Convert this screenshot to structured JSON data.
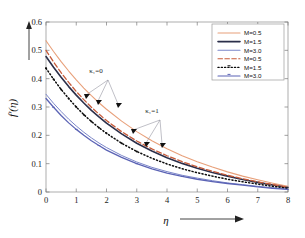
{
  "chart_data": {
    "type": "line",
    "title": "",
    "subtitle": "",
    "xlabel": "η",
    "ylabel": "f'(η)",
    "xlim": [
      0,
      8
    ],
    "ylim": [
      0,
      0.6
    ],
    "xticks": [
      "0",
      "1",
      "2",
      "3",
      "4",
      "5",
      "6",
      "7",
      "8"
    ],
    "yticks": [
      "0",
      "0.1",
      "0.2",
      "0.3",
      "0.4",
      "0.5",
      "0.6"
    ],
    "xtick_values": [
      0,
      1,
      2,
      3,
      4,
      5,
      6,
      7,
      8
    ],
    "ytick_values": [
      0,
      0.1,
      0.2,
      0.3,
      0.4,
      0.5,
      0.6
    ],
    "grid": false,
    "legend_position": "top-right",
    "x": [
      0,
      0.25,
      0.5,
      0.75,
      1.0,
      1.25,
      1.5,
      1.75,
      2.0,
      2.5,
      3.0,
      3.5,
      4.0,
      4.5,
      5.0,
      5.5,
      6.0,
      6.5,
      7.0,
      7.5,
      8.0
    ],
    "series": [
      {
        "name": "M=0.5",
        "group": "κ₁=0",
        "style": "solid",
        "color": "#e8a07a",
        "marker": "none",
        "width": 1.1,
        "values": [
          0.534,
          0.496,
          0.46,
          0.427,
          0.396,
          0.367,
          0.34,
          0.315,
          0.292,
          0.25,
          0.213,
          0.181,
          0.153,
          0.128,
          0.107,
          0.088,
          0.071,
          0.056,
          0.043,
          0.031,
          0.02
        ]
      },
      {
        "name": "M=1.5",
        "group": "κ₁=0",
        "style": "solid",
        "color": "#2b2f4a",
        "marker": "none",
        "width": 1.6,
        "values": [
          0.478,
          0.44,
          0.405,
          0.372,
          0.342,
          0.314,
          0.288,
          0.265,
          0.243,
          0.205,
          0.172,
          0.145,
          0.121,
          0.101,
          0.084,
          0.069,
          0.056,
          0.044,
          0.034,
          0.025,
          0.016
        ]
      },
      {
        "name": "M=3.0",
        "group": "κ₁=0",
        "style": "solid",
        "color": "#7b86c9",
        "marker": "none",
        "width": 1.0,
        "values": [
          0.345,
          0.313,
          0.284,
          0.257,
          0.233,
          0.211,
          0.191,
          0.173,
          0.157,
          0.129,
          0.106,
          0.087,
          0.072,
          0.059,
          0.049,
          0.04,
          0.032,
          0.026,
          0.02,
          0.015,
          0.01
        ]
      },
      {
        "name": "M=0.5",
        "group": "κ₁=1",
        "style": "dashed",
        "color": "#c75b3a",
        "marker": "none",
        "width": 1.3,
        "values": [
          0.5,
          0.459,
          0.421,
          0.387,
          0.355,
          0.326,
          0.299,
          0.275,
          0.252,
          0.213,
          0.18,
          0.152,
          0.128,
          0.107,
          0.089,
          0.073,
          0.059,
          0.047,
          0.036,
          0.026,
          0.017
        ]
      },
      {
        "name": "M=1.5",
        "group": "κ₁=1",
        "style": "dotted-marker",
        "color": "#0b0b0b",
        "marker": "dot",
        "width": 1.5,
        "values": [
          0.437,
          0.398,
          0.362,
          0.33,
          0.3,
          0.273,
          0.249,
          0.227,
          0.207,
          0.172,
          0.143,
          0.119,
          0.099,
          0.082,
          0.068,
          0.056,
          0.045,
          0.036,
          0.028,
          0.02,
          0.013
        ]
      },
      {
        "name": "M=3.0",
        "group": "κ₁=1",
        "style": "solid-marker",
        "color": "#5b63b5",
        "marker": "tick",
        "width": 1.3,
        "values": [
          0.33,
          0.299,
          0.27,
          0.244,
          0.221,
          0.2,
          0.181,
          0.164,
          0.148,
          0.122,
          0.1,
          0.082,
          0.067,
          0.055,
          0.045,
          0.037,
          0.03,
          0.024,
          0.018,
          0.013,
          0.009
        ]
      }
    ],
    "annotations": [
      {
        "text": "κ₁=0",
        "x_px": 96,
        "y_px": 73
      },
      {
        "text": "κ₁=1",
        "x_px": 152,
        "y_px": 113
      }
    ]
  },
  "legend": {
    "entries": [
      {
        "label": "M=0.5",
        "color": "#e8a07a",
        "style": "solid"
      },
      {
        "label": "M=1.5",
        "color": "#2b2f4a",
        "style": "solid"
      },
      {
        "label": "M=3.0",
        "color": "#7b86c9",
        "style": "solid"
      },
      {
        "label": "M=0.5",
        "color": "#c75b3a",
        "style": "dashed"
      },
      {
        "label": "M=1.5",
        "color": "#0b0b0b",
        "style": "dotted-marker"
      },
      {
        "label": "M=3.0",
        "color": "#5b63b5",
        "style": "solid-marker"
      }
    ]
  },
  "axes": {
    "x_title": "η",
    "y_title": "f'(η)"
  }
}
